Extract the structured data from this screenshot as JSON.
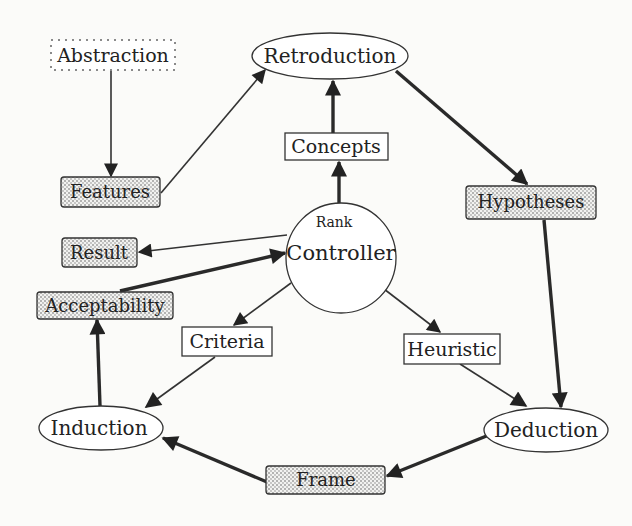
{
  "diagram": {
    "title": "",
    "nodes": {
      "abstraction": {
        "label": "Abstraction",
        "shape": "dashed-rect"
      },
      "retroduction": {
        "label": "Retroduction",
        "shape": "ellipse"
      },
      "concepts": {
        "label": "Concepts",
        "shape": "rect"
      },
      "features": {
        "label": "Features",
        "shape": "stippled-rounded-rect"
      },
      "hypotheses": {
        "label": "Hypotheses",
        "shape": "stippled-rounded-rect"
      },
      "controller": {
        "label": "Controller",
        "sublabel": "Rank",
        "shape": "circle"
      },
      "result": {
        "label": "Result",
        "shape": "stippled-rounded-rect"
      },
      "acceptability": {
        "label": "Acceptability",
        "shape": "stippled-rounded-rect"
      },
      "criteria": {
        "label": "Criteria",
        "shape": "rect"
      },
      "heuristic": {
        "label": "Heuristic",
        "shape": "rect"
      },
      "induction": {
        "label": "Induction",
        "shape": "ellipse"
      },
      "deduction": {
        "label": "Deduction",
        "shape": "ellipse"
      },
      "frame": {
        "label": "Frame",
        "shape": "stippled-rounded-rect"
      }
    },
    "edges": [
      {
        "from": "Abstraction",
        "to": "Features",
        "weight": "thin"
      },
      {
        "from": "Features",
        "to": "Retroduction",
        "weight": "thin"
      },
      {
        "from": "Concepts",
        "to": "Retroduction",
        "weight": "thick"
      },
      {
        "from": "Controller",
        "to": "Concepts",
        "weight": "thick"
      },
      {
        "from": "Retroduction",
        "to": "Hypotheses",
        "weight": "thick"
      },
      {
        "from": "Hypotheses",
        "to": "Deduction",
        "weight": "thick"
      },
      {
        "from": "Controller",
        "to": "Result",
        "weight": "thin"
      },
      {
        "from": "Acceptability",
        "to": "Controller",
        "weight": "thick"
      },
      {
        "from": "Controller",
        "to": "Criteria",
        "weight": "thin"
      },
      {
        "from": "Controller",
        "to": "Heuristic",
        "weight": "thin"
      },
      {
        "from": "Criteria",
        "to": "Induction",
        "weight": "thin"
      },
      {
        "from": "Heuristic",
        "to": "Deduction",
        "weight": "thin"
      },
      {
        "from": "Induction",
        "to": "Acceptability",
        "weight": "thick"
      },
      {
        "from": "Deduction",
        "to": "Frame",
        "weight": "thick"
      },
      {
        "from": "Frame",
        "to": "Induction",
        "weight": "thick"
      }
    ],
    "colors": {
      "stroke": "#333333",
      "background": "#fbfbf9",
      "stipple_dot": "#555555"
    }
  }
}
